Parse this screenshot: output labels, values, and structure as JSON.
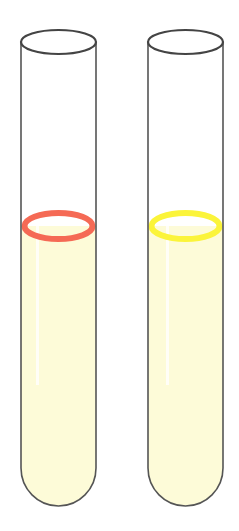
{
  "diagram": {
    "type": "test-tubes",
    "tubes": [
      {
        "id": "left",
        "liquid_color": "#fdfbd8",
        "ring_color": "#f56a55",
        "ring_label": "red ring"
      },
      {
        "id": "right",
        "liquid_color": "#fdfbd8",
        "ring_color": "#fbf43a",
        "ring_label": "yellow ring"
      }
    ],
    "outline_color": "#444444"
  }
}
